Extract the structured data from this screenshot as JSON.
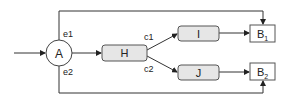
{
  "diagram": {
    "nodes": {
      "A": {
        "label": "A",
        "shape": "circle"
      },
      "H": {
        "label": "H",
        "shape": "rounded-rect"
      },
      "I": {
        "label": "I",
        "shape": "rounded-rect"
      },
      "J": {
        "label": "J",
        "shape": "rounded-rect"
      },
      "B1": {
        "label": "B",
        "subscript": "1",
        "shape": "rect"
      },
      "B2": {
        "label": "B",
        "subscript": "2",
        "shape": "rect"
      }
    },
    "edge_labels": {
      "e1": "e1",
      "e2": "e2",
      "c1": "c1",
      "c2": "c2"
    },
    "edges": [
      {
        "from": "input",
        "to": "A"
      },
      {
        "from": "A",
        "to": "H"
      },
      {
        "from": "A",
        "to": "B1",
        "label": "e1"
      },
      {
        "from": "A",
        "to": "B2",
        "label": "e2"
      },
      {
        "from": "H",
        "to": "I",
        "label": "c1"
      },
      {
        "from": "H",
        "to": "J",
        "label": "c2"
      },
      {
        "from": "I",
        "to": "B1"
      },
      {
        "from": "J",
        "to": "B2"
      }
    ],
    "colors": {
      "line": "#333333",
      "box_fill": "#e6e6e6",
      "box_stroke": "#555555",
      "b_fill": "#ffffff"
    }
  }
}
